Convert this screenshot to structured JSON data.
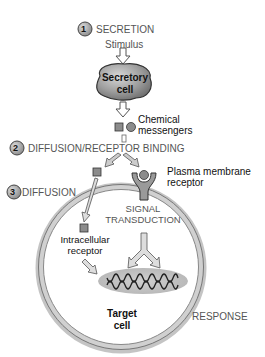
{
  "steps": [
    {
      "number": "1",
      "label": "SECRETION"
    },
    {
      "number": "2",
      "label": "DIFFUSION/RECEPTOR BINDING"
    },
    {
      "number": "3",
      "label": "DIFFUSION"
    }
  ],
  "labels": {
    "stimulus": "Stimulus",
    "secretory_cell_line1": "Secretory",
    "secretory_cell_line2": "cell",
    "chemical_messengers_line1": "Chemical",
    "chemical_messengers_line2": "messengers",
    "plasma_membrane_receptor_line1": "Plasma membrane",
    "plasma_membrane_receptor_line2": "receptor",
    "signal_transduction_line1": "SIGNAL",
    "signal_transduction_line2": "TRANSDUCTION",
    "intracellular_receptor_line1": "Intracellular",
    "intracellular_receptor_line2": "receptor",
    "target_cell_line1": "Target",
    "target_cell_line2": "cell",
    "response": "RESPONSE"
  },
  "colors": {
    "step_circle": "#a8a8a8",
    "cell_fill": "#9a9a9a",
    "messenger_fill": "#8c8c8c",
    "nucleus_fill": "#c4c4c4",
    "membrane": "#bdbdbd"
  }
}
